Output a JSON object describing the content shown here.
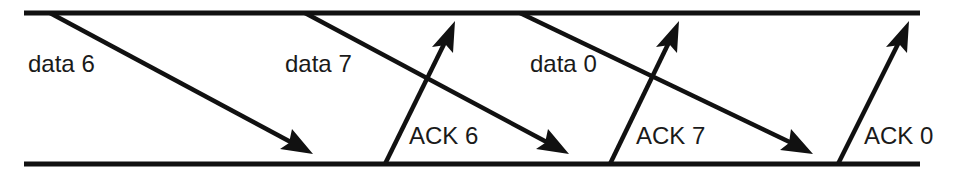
{
  "diagram": {
    "type": "sliding-window-timeline",
    "timelines": {
      "top": "sender",
      "bottom": "receiver"
    },
    "messages": [
      {
        "label": "data 6",
        "direction": "down"
      },
      {
        "label": "data 7",
        "direction": "down"
      },
      {
        "label": "data 0",
        "direction": "down"
      },
      {
        "label": "ACK 6",
        "direction": "up"
      },
      {
        "label": "ACK 7",
        "direction": "up"
      },
      {
        "label": "ACK 0",
        "direction": "up"
      }
    ],
    "colors": {
      "line": "#111111",
      "background": "#ffffff"
    }
  }
}
